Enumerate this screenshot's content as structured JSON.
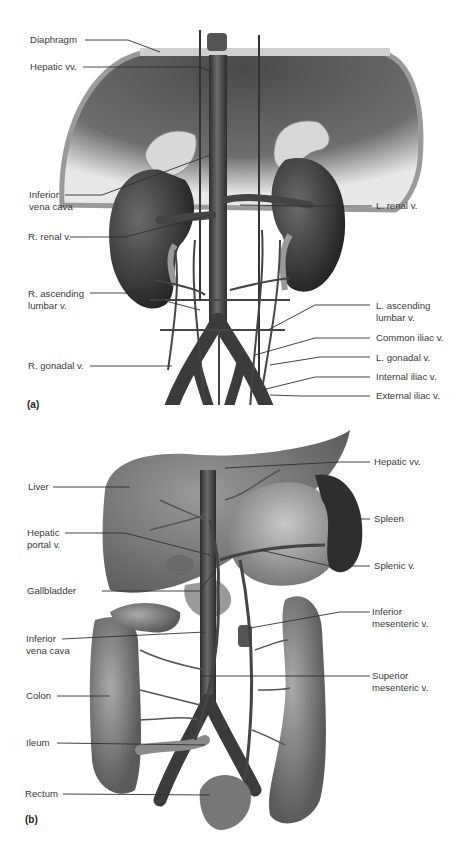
{
  "figure": {
    "panels": [
      {
        "id": "a",
        "tag": "(a)",
        "title": "Inferior vena cava and tributaries (posterior abdominal wall)",
        "labels": {
          "diaphragm": "Diaphragm",
          "hepatic_vv": "Hepatic vv.",
          "ivc_line1": "Inferior",
          "ivc_line2": "vena cava",
          "r_renal": "R. renal v.",
          "r_asc_lumbar_line1": "R. ascending",
          "r_asc_lumbar_line2": "lumbar v.",
          "r_gonadal": "R. gonadal v.",
          "l_renal": "L. renal v.",
          "l_asc_lumbar_line1": "L. ascending",
          "l_asc_lumbar_line2": "lumbar v.",
          "common_iliac": "Common iliac v.",
          "l_gonadal": "L. gonadal v.",
          "internal_iliac": "Internal iliac v.",
          "external_iliac": "External iliac v."
        }
      },
      {
        "id": "b",
        "tag": "(b)",
        "title": "Hepatic portal system",
        "labels": {
          "liver": "Liver",
          "hepatic_portal_line1": "Hepatic",
          "hepatic_portal_line2": "portal v.",
          "gallbladder": "Gallbladder",
          "ivc_line1": "Inferior",
          "ivc_line2": "vena cava",
          "colon": "Colon",
          "ileum": "Ileum",
          "rectum": "Rectum",
          "hepatic_vv": "Hepatic vv.",
          "spleen": "Spleen",
          "splenic": "Splenic v.",
          "inf_mesenteric_line1": "Inferior",
          "inf_mesenteric_line2": "mesenteric v.",
          "sup_mesenteric_line1": "Superior",
          "sup_mesenteric_line2": "mesenteric v."
        }
      }
    ],
    "colors": {
      "label_text": "#3a3a3a",
      "leader_line": "#2f2f2f",
      "vein_dark": "#3c3c3c",
      "organ_mid": "#8a8a8a",
      "organ_light": "#c9c9c9",
      "background": "#ffffff"
    }
  }
}
